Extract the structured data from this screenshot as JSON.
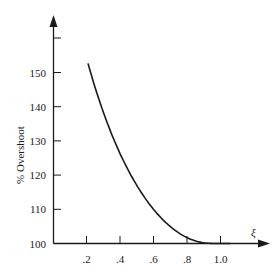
{
  "chart_data": {
    "type": "line",
    "title": "",
    "xlabel": "ξ",
    "ylabel": "% Overshoot",
    "x_ticks": [
      ".2",
      ".4",
      ".6",
      ".8",
      "1.0"
    ],
    "x_tick_values": [
      0.2,
      0.4,
      0.6,
      0.8,
      1.0
    ],
    "y_ticks": [
      "100",
      "110",
      "120",
      "130",
      "140",
      "150"
    ],
    "y_tick_values": [
      100,
      110,
      120,
      130,
      140,
      150
    ],
    "xlim": [
      0,
      1.3
    ],
    "ylim": [
      100,
      160
    ],
    "grid": false,
    "legend": null,
    "series": [
      {
        "name": "% Overshoot vs damping ratio",
        "x": [
          0.2,
          0.3,
          0.4,
          0.5,
          0.6,
          0.7,
          0.8,
          0.9,
          1.0,
          1.05
        ],
        "y": [
          152.7,
          137.2,
          125.4,
          116.3,
          109.5,
          104.6,
          101.5,
          100.2,
          100.0,
          100.0
        ]
      }
    ]
  }
}
